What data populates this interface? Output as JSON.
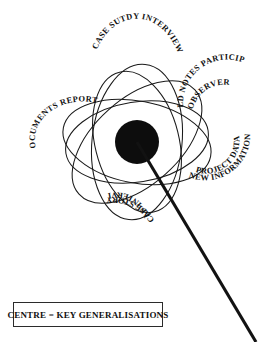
{
  "diagram": {
    "centre": {
      "label": "key generalisations",
      "shape": "filled-circle",
      "color": "#0d0d0d",
      "cx": 137,
      "cy": 142,
      "r": 22
    },
    "pointer": {
      "from_x": 137,
      "from_y": 142,
      "to_x": 256,
      "to_y": 342,
      "color": "#121212"
    },
    "outline_color": "#1a1a1a",
    "background_color": "#ffffff",
    "petals": [
      {
        "id": "case-study-interview",
        "position": "top",
        "main_label": "CASE SUTDY INTERVIEW",
        "sub_label": "",
        "angle_deg": -84
      },
      {
        "id": "field-notes-participant-observer",
        "position": "upper-right",
        "main_label": "FIELD NOTES PARTICIPANT",
        "sub_label": "OBSERVER",
        "angle_deg": -38
      },
      {
        "id": "new-information-project-data",
        "position": "right",
        "main_label": "NEW INFORMATION",
        "sub_label": "PROJECT DATA",
        "angle_deg": 14
      },
      {
        "id": "case-story-self-interview",
        "position": "bottom",
        "main_label": "CASE STORY",
        "sub_label": "SELF-INTERVIEW",
        "angle_deg": 80
      },
      {
        "id": "documents-reports",
        "position": "left",
        "main_label": "DOCUMENTS REPORTS",
        "sub_label": "",
        "angle_deg": 170
      }
    ]
  },
  "caption": {
    "text": "CENTRE = KEY GENERALISATIONS"
  }
}
